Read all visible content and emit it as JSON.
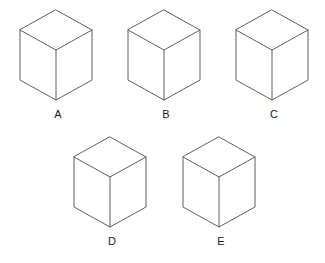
{
  "figure": {
    "kind": "spatial-reasoning-cube-puzzle",
    "background_color": "#ffffff",
    "edge_color": "#4d4d4d",
    "letter_color": "#2b2b2b",
    "label_color": "#1a1a1a"
  },
  "cubes": [
    {
      "label": "A",
      "label_x": 58,
      "label_y": 118,
      "origin_x": 20,
      "origin_y": 10,
      "faces": {
        "top": "E",
        "left": "N",
        "right": "S"
      },
      "face_letters": {
        "top": {
          "letter": "E",
          "style": "serif-script"
        },
        "left": {
          "letter": "N",
          "style": "plain"
        },
        "right": {
          "letter": "S",
          "style": "serif-script"
        }
      }
    },
    {
      "label": "B",
      "label_x": 166,
      "label_y": 118,
      "origin_x": 128,
      "origin_y": 10,
      "faces": {
        "top": "O",
        "left": "H",
        "right": "N"
      },
      "face_letters": {
        "top": {
          "letter": "O",
          "style": "plain"
        },
        "left": {
          "letter": "H",
          "style": "plain"
        },
        "right": {
          "letter": "N",
          "style": "plain"
        }
      }
    },
    {
      "label": "C",
      "label_x": 274,
      "label_y": 118,
      "origin_x": 236,
      "origin_y": 10,
      "faces": {
        "top": "N",
        "left": "O",
        "right": "N"
      },
      "face_letters": {
        "top": {
          "letter": "N",
          "style": "plain"
        },
        "left": {
          "letter": "O",
          "style": "plain"
        },
        "right": {
          "letter": "N",
          "style": "plain"
        }
      }
    },
    {
      "label": "D",
      "label_x": 112,
      "label_y": 245,
      "origin_x": 74,
      "origin_y": 137,
      "faces": {
        "top": "S",
        "left": "O",
        "right": "N"
      },
      "face_letters": {
        "top": {
          "letter": "S",
          "style": "serif-script"
        },
        "left": {
          "letter": "O",
          "style": "plain"
        },
        "right": {
          "letter": "N",
          "style": "plain"
        }
      }
    },
    {
      "label": "E",
      "label_x": 221,
      "label_y": 245,
      "origin_x": 183,
      "origin_y": 137,
      "faces": {
        "top": "E",
        "left": "N",
        "right": "H"
      },
      "face_letters": {
        "top": {
          "letter": "E",
          "style": "plain"
        },
        "left": {
          "letter": "N",
          "style": "plain"
        },
        "right": {
          "letter": "H",
          "style": "plain"
        }
      }
    }
  ]
}
